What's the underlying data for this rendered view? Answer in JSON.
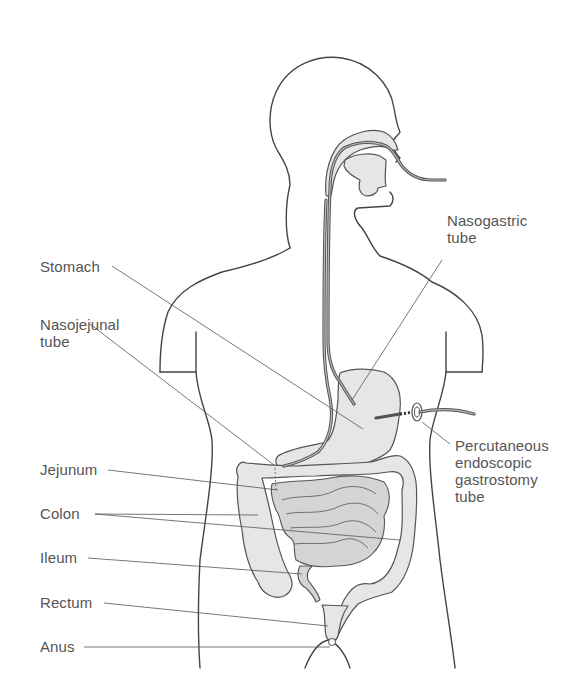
{
  "figure": {
    "colors": {
      "outline": "#444444",
      "organ_fill": "#e6e6e6",
      "label_text": "#555555",
      "background": "#ffffff"
    }
  },
  "labels": [
    {
      "id": "nasogastric-tube",
      "text": "Nasogastric\ntube",
      "x": 447,
      "y": 221
    },
    {
      "id": "stomach",
      "text": "Stomach",
      "x": 40,
      "y": 258
    },
    {
      "id": "nasojejunal-tube",
      "text": "Nasojejunal\ntube",
      "x": 40,
      "y": 318
    },
    {
      "id": "percutaneous-endoscopic-gastrostomy-tube",
      "text": "Percutaneous\nendoscopic\ngastrostomy\ntube",
      "x": 455,
      "y": 437
    },
    {
      "id": "jejunum",
      "text": "Jejunum",
      "x": 40,
      "y": 463
    },
    {
      "id": "colon",
      "text": "Colon",
      "x": 40,
      "y": 508
    },
    {
      "id": "ileum",
      "text": "Ileum",
      "x": 40,
      "y": 552
    },
    {
      "id": "rectum",
      "text": "Rectum",
      "x": 40,
      "y": 597
    },
    {
      "id": "anus",
      "text": "Anus",
      "x": 40,
      "y": 642
    }
  ]
}
